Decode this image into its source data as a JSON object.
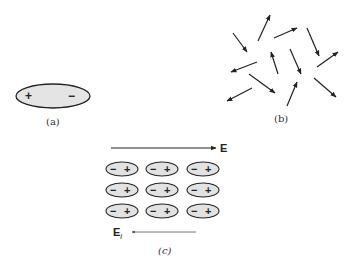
{
  "figure": {
    "panel_a": {
      "label": "(a)",
      "molecule": {
        "plus": "+",
        "minus": "−"
      }
    },
    "panel_b": {
      "label": "(b)",
      "description": "randomly oriented dipoles",
      "arrows": [
        {
          "x1": 233,
          "y1": 33,
          "x2": 247,
          "y2": 52
        },
        {
          "x1": 258,
          "y1": 41,
          "x2": 270,
          "y2": 15
        },
        {
          "x1": 274,
          "y1": 38,
          "x2": 297,
          "y2": 28
        },
        {
          "x1": 307,
          "y1": 28,
          "x2": 319,
          "y2": 56
        },
        {
          "x1": 257,
          "y1": 62,
          "x2": 231,
          "y2": 72
        },
        {
          "x1": 278,
          "y1": 74,
          "x2": 271,
          "y2": 52
        },
        {
          "x1": 290,
          "y1": 49,
          "x2": 301,
          "y2": 74
        },
        {
          "x1": 317,
          "y1": 67,
          "x2": 338,
          "y2": 52
        },
        {
          "x1": 249,
          "y1": 74,
          "x2": 275,
          "y2": 93
        },
        {
          "x1": 252,
          "y1": 88,
          "x2": 227,
          "y2": 101
        },
        {
          "x1": 287,
          "y1": 106,
          "x2": 297,
          "y2": 82
        },
        {
          "x1": 314,
          "y1": 78,
          "x2": 336,
          "y2": 97
        }
      ]
    },
    "panel_c": {
      "label": "(c)",
      "applied_field_label": "E",
      "induced_field_label": "E",
      "induced_field_subscript": "i",
      "dipole": {
        "minus": "−",
        "plus": "+"
      },
      "grid": {
        "rows": 3,
        "cols": 3
      }
    }
  }
}
